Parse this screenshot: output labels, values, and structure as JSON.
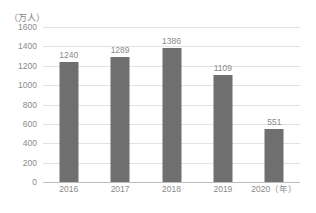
{
  "chart_data": {
    "type": "bar",
    "title": "",
    "subtitle": "",
    "xlabel": "（年）",
    "ylabel": "（万人）",
    "categories": [
      "2016",
      "2017",
      "2018",
      "2019",
      "2020"
    ],
    "values": [
      1240,
      1289,
      1386,
      1109,
      551
    ],
    "series": [
      {
        "name": "",
        "values": [
          1240,
          1289,
          1386,
          1109,
          551
        ]
      }
    ],
    "data_labels": [
      "1240",
      "1289",
      "1386",
      "1109",
      "551"
    ],
    "ylim": [
      0,
      1600
    ],
    "ytick_step": 200,
    "ytick_labels": [
      "0",
      "200",
      "400",
      "600",
      "800",
      "1000",
      "1200",
      "1400",
      "1600"
    ],
    "ytick_values": [
      0,
      200,
      400,
      600,
      800,
      1000,
      1200,
      1400,
      1600
    ],
    "xtick_labels": [
      "2016",
      "2017",
      "2018",
      "2019",
      "2020（年）"
    ],
    "grid": true,
    "grid_axis": "y",
    "legend": false,
    "legend_position": "none",
    "colors": {
      "bar": "#706f6f",
      "grid": "#e2e2e2",
      "axis": "#bdbdbd",
      "text": "#8a8a8a",
      "background": "#ffffff"
    }
  }
}
